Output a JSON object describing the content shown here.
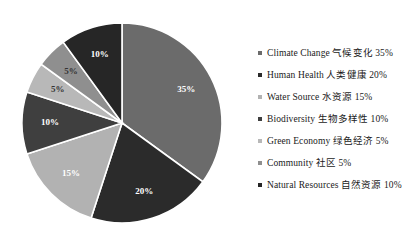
{
  "chart_data": {
    "type": "pie",
    "title": "",
    "legend_position": "right",
    "start_angle_deg": 0,
    "direction": "clockwise",
    "categories": [
      "Climate Change 气候变化",
      "Human Health 人类健康",
      "Water Source 水资源",
      "Biodiversity 生物多样性",
      "Green Economy 绿色经济",
      "Community 社区",
      "Natural Resources 自然资源"
    ],
    "values": [
      35,
      20,
      15,
      10,
      5,
      5,
      10
    ],
    "value_labels": [
      "35%",
      "20%",
      "15%",
      "10%",
      "5%",
      "5%",
      "10%"
    ],
    "colors": [
      "#6b6b6b",
      "#2b2b2b",
      "#b2b2b2",
      "#3f3f3f",
      "#b8b8b8",
      "#8f8f8f",
      "#262626"
    ],
    "label_text_colors": [
      "#ffffff",
      "#ffffff",
      "#ffffff",
      "#ffffff",
      "#333333",
      "#333333",
      "#ffffff"
    ],
    "slices": [
      {
        "label": "Climate Change 气候变化",
        "value": 35,
        "value_label": "35%",
        "color": "#6b6b6b"
      },
      {
        "label": "Human Health 人类健康",
        "value": 20,
        "value_label": "20%",
        "color": "#2b2b2b"
      },
      {
        "label": "Water Source 水资源",
        "value": 15,
        "value_label": "15%",
        "color": "#b2b2b2"
      },
      {
        "label": "Biodiversity 生物多样性",
        "value": 10,
        "value_label": "10%",
        "color": "#3f3f3f"
      },
      {
        "label": "Green Economy 绿色经济",
        "value": 5,
        "value_label": "5%",
        "color": "#b8b8b8"
      },
      {
        "label": "Community 社区",
        "value": 5,
        "value_label": "5%",
        "color": "#8f8f8f"
      },
      {
        "label": "Natural Resources 自然资源",
        "value": 10,
        "value_label": "10%",
        "color": "#262626"
      }
    ]
  },
  "legend": {
    "items": [
      {
        "label": "Climate Change 气候变化 35%",
        "color": "#6b6b6b"
      },
      {
        "label": "Human Health 人类健康 20%",
        "color": "#2b2b2b"
      },
      {
        "label": "Water Source 水资源 15%",
        "color": "#b2b2b2"
      },
      {
        "label": "Biodiversity 生物多样性 10%",
        "color": "#3f3f3f"
      },
      {
        "label": "Green Economy 绿色经济 5%",
        "color": "#b8b8b8"
      },
      {
        "label": "Community 社区 5%",
        "color": "#8f8f8f"
      },
      {
        "label": "Natural Resources 自然资源 10%",
        "color": "#262626"
      }
    ]
  },
  "geometry": {
    "center_x": 122,
    "center_y": 123,
    "radius": 100,
    "label_radius_ratio": 0.72
  }
}
